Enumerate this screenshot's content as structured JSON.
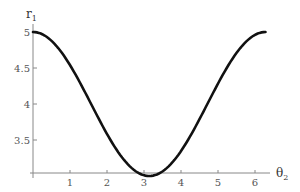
{
  "chart_data": {
    "type": "line",
    "title": "",
    "xlabel": "θ",
    "xlabel_sub": "2",
    "ylabel": "r",
    "ylabel_sub": "1",
    "x_ticks": [
      "1",
      "2",
      "3",
      "4",
      "5",
      "6"
    ],
    "y_ticks": [
      "3.5",
      "4",
      "4.5",
      "5"
    ],
    "xlim": [
      0,
      6.2832
    ],
    "ylim": [
      3.0,
      5.0
    ],
    "grid": false,
    "legend": null,
    "series": [
      {
        "name": "r1",
        "x": [
          0,
          0.5,
          1.0,
          1.5,
          2.0,
          2.5,
          3.0,
          3.1416,
          3.5,
          4.0,
          4.5,
          5.0,
          5.5,
          6.0,
          6.2832
        ],
        "values": [
          5.0,
          4.88,
          4.54,
          4.07,
          3.58,
          3.2,
          3.01,
          3.0,
          3.06,
          3.35,
          3.79,
          4.28,
          4.71,
          4.96,
          5.0
        ]
      }
    ],
    "line_color": "#111111"
  }
}
